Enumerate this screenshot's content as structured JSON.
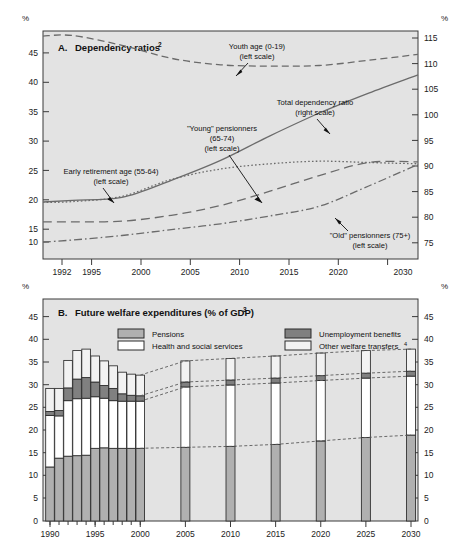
{
  "figure": {
    "panels": [
      {
        "id": "A",
        "label": "A.",
        "title": "Dependency ratios",
        "title_sup": "2"
      },
      {
        "id": "B",
        "label": "B.",
        "title": "Future welfare expenditures (% of GDP)",
        "title_sup": "3"
      }
    ],
    "axis_unit_label": "%"
  },
  "panelB_legend": [
    {
      "label": "Pensions",
      "sup": "",
      "color": "#b0b0b0",
      "name": "legend-pensions"
    },
    {
      "label": "Health and social services",
      "sup": "",
      "color": "#ffffff",
      "name": "legend-health"
    },
    {
      "label": "Unemployment benefits",
      "sup": "",
      "color": "#808080",
      "name": "legend-unemployment"
    },
    {
      "label": "Other welfare transfers",
      "sup": "4",
      "color": "#f2f2f2",
      "name": "legend-other"
    }
  ],
  "annotations_A": [
    {
      "lines": [
        "Youth age (0-19)",
        "(left scale)"
      ],
      "name": "annotation-youth-age"
    },
    {
      "lines": [
        "Total dependency ratio",
        "(right scale)"
      ],
      "name": "annotation-total-dependency"
    },
    {
      "lines": [
        "\"Young\" pensionners",
        "(65-74)",
        "(left scale)"
      ],
      "name": "annotation-young-pensionners"
    },
    {
      "lines": [
        "Early retirement age (55-64)",
        "(left scale)"
      ],
      "name": "annotation-early-retirement"
    },
    {
      "lines": [
        "\"Old\" pensionners (75+)",
        "(left scale)"
      ],
      "name": "annotation-old-pensionners"
    }
  ],
  "chart_data": [
    {
      "type": "line",
      "panel": "A",
      "title": "A. Dependency ratios",
      "xlabel": "",
      "ylabel": "%",
      "y2label": "%",
      "grid": false,
      "legend_position": "inline-annotations",
      "xlim": [
        1992,
        2030
      ],
      "ylim": [
        10,
        45
      ],
      "y2lim": [
        75,
        115
      ],
      "xticks": [
        1992,
        1995,
        2000,
        2005,
        2010,
        2015,
        2020,
        2030
      ],
      "xtick_labels": [
        "1992",
        "1995",
        "2000",
        "2005",
        "2010",
        "2015",
        "2020",
        "2030"
      ],
      "yticks": [
        10,
        15,
        20,
        25,
        30,
        35,
        40,
        45
      ],
      "y2ticks": [
        75,
        80,
        85,
        90,
        95,
        100,
        105,
        110,
        115
      ],
      "series": [
        {
          "name": "Youth age (0-19)",
          "scale": "left",
          "style": "dashed",
          "x": [
            1992,
            1995,
            2000,
            2005,
            2010,
            2015,
            2020,
            2025,
            2030
          ],
          "values": [
            41.6,
            41.7,
            40.2,
            38.2,
            37.2,
            37.0,
            37.1,
            37.9,
            38.8
          ]
        },
        {
          "name": "Total dependency ratio",
          "scale": "right",
          "style": "solid",
          "x": [
            1992,
            1995,
            2000,
            2005,
            2010,
            2015,
            2020,
            2025,
            2030
          ],
          "values": [
            82.2,
            82.5,
            83.0,
            86.0,
            89.5,
            93.8,
            97.8,
            101.3,
            104.5
          ]
        },
        {
          "name": "\"Young\" pensionners (65-74)",
          "scale": "left",
          "style": "long-dash",
          "x": [
            1992,
            1995,
            2000,
            2005,
            2010,
            2015,
            2020,
            2025,
            2030
          ],
          "values": [
            13.1,
            13.1,
            13.2,
            14.1,
            15.6,
            17.8,
            20.2,
            22.2,
            22.3
          ]
        },
        {
          "name": "Early retirement age (55-64)",
          "scale": "left",
          "style": "dotted",
          "x": [
            1992,
            1995,
            2000,
            2005,
            2010,
            2015,
            2020,
            2025,
            2030
          ],
          "values": [
            16.1,
            16.2,
            17.0,
            19.6,
            21.2,
            22.0,
            22.4,
            22.2,
            22.0
          ]
        },
        {
          "name": "\"Old\" pensionners (75+)",
          "scale": "left",
          "style": "dash-dot",
          "x": [
            1992,
            1995,
            2000,
            2005,
            2010,
            2015,
            2020,
            2025,
            2030
          ],
          "values": [
            10.0,
            10.3,
            11.0,
            11.9,
            12.8,
            14.0,
            15.5,
            18.6,
            21.9
          ]
        }
      ]
    },
    {
      "type": "bar",
      "panel": "B",
      "stacked": true,
      "title": "B. Future welfare expenditures (% of GDP)",
      "xlabel": "",
      "ylabel": "%",
      "y2label": "%",
      "grid": false,
      "legend_position": "top",
      "ylim": [
        0,
        45
      ],
      "yticks": [
        0,
        5,
        10,
        15,
        20,
        25,
        30,
        35,
        40,
        45
      ],
      "xticks": [
        1990,
        1995,
        2000,
        2005,
        2010,
        2015,
        2020,
        2025,
        2030
      ],
      "xtick_labels": [
        "1990",
        "1995",
        "2000",
        "2005",
        "2010",
        "2015",
        "2020",
        "2025",
        "2030"
      ],
      "categories": [
        "1990",
        "1991",
        "1992",
        "1993",
        "1994",
        "1995",
        "1996",
        "1997",
        "1998",
        "1999",
        "2000",
        "2005",
        "2010",
        "2015",
        "2020",
        "2025",
        "2030"
      ],
      "series": [
        {
          "name": "Pensions",
          "color": "#b0b0b0",
          "values": [
            11.0,
            12.8,
            13.2,
            13.3,
            13.4,
            14.8,
            14.9,
            14.8,
            14.8,
            14.8,
            14.8,
            15.0,
            15.2,
            15.6,
            16.3,
            17.0,
            17.5
          ]
        },
        {
          "name": "Health and social services",
          "color": "#ffffff",
          "values": [
            10.5,
            8.6,
            11.3,
            11.6,
            11.6,
            10.5,
            10.1,
            9.7,
            9.6,
            9.6,
            9.6,
            12.3,
            12.5,
            12.5,
            12.3,
            12.1,
            12.0
          ]
        },
        {
          "name": "Unemployment benefits",
          "color": "#808080",
          "values": [
            0.8,
            1.1,
            2.6,
            4.0,
            4.2,
            3.0,
            2.6,
            2.5,
            1.5,
            1.2,
            1.1,
            1.0,
            1.0,
            1.0,
            1.0,
            1.0,
            1.0
          ]
        },
        {
          "name": "Other welfare transfers",
          "color": "#f2f2f2",
          "values": [
            4.7,
            4.5,
            5.6,
            5.8,
            5.8,
            5.3,
            5.0,
            4.6,
            4.4,
            4.3,
            4.2,
            4.3,
            4.4,
            4.5,
            4.6,
            4.6,
            4.5
          ]
        }
      ]
    }
  ]
}
